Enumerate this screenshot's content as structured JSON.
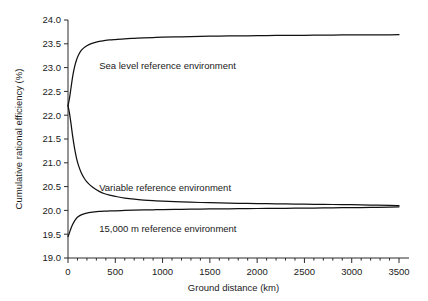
{
  "chart_data": {
    "type": "line",
    "title": "",
    "xlabel": "Ground distance (km)",
    "ylabel": "Cumulative rational efficiency (%)",
    "xlim": [
      0,
      3500
    ],
    "ylim": [
      19.0,
      24.0
    ],
    "xticks": [
      0,
      500,
      1000,
      1500,
      2000,
      2500,
      3000,
      3500
    ],
    "xtick_labels": [
      "0",
      "500",
      "1000",
      "1500",
      "2000",
      "2500",
      "3000",
      "3500"
    ],
    "xminor_step": 100,
    "yticks": [
      19.0,
      19.5,
      20.0,
      20.5,
      21.0,
      21.5,
      22.0,
      22.5,
      23.0,
      23.5,
      24.0
    ],
    "ytick_labels": [
      "19.0",
      "19.5",
      "20.0",
      "20.5",
      "21.0",
      "21.5",
      "22.0",
      "22.5",
      "23.0",
      "23.5",
      "24.0"
    ],
    "grid": false,
    "legend": "inline-annotations",
    "line_color": "#111111",
    "series": [
      {
        "name": "Sea level reference environment",
        "label_position": {
          "x": 330,
          "y": 23.05
        },
        "x": [
          0,
          15,
          30,
          50,
          70,
          90,
          110,
          140,
          170,
          200,
          240,
          280,
          330,
          380,
          440,
          500,
          600,
          700,
          800,
          900,
          1000,
          1200,
          1400,
          1600,
          1800,
          2000,
          2200,
          2400,
          2600,
          2800,
          3000,
          3200,
          3400,
          3500
        ],
        "y": [
          22.2,
          22.35,
          22.55,
          22.82,
          23.02,
          23.16,
          23.26,
          23.36,
          23.42,
          23.46,
          23.5,
          23.525,
          23.55,
          23.565,
          23.58,
          23.59,
          23.605,
          23.615,
          23.625,
          23.632,
          23.638,
          23.648,
          23.656,
          23.662,
          23.667,
          23.671,
          23.675,
          23.678,
          23.681,
          23.684,
          23.686,
          23.688,
          23.69,
          23.691
        ]
      },
      {
        "name": "Variable reference environment",
        "label_position": {
          "x": 330,
          "y": 20.47
        },
        "x": [
          0,
          15,
          30,
          50,
          70,
          90,
          110,
          140,
          170,
          200,
          240,
          280,
          330,
          380,
          440,
          500,
          600,
          700,
          800,
          900,
          1000,
          1200,
          1400,
          1600,
          1800,
          2000,
          2200,
          2400,
          2600,
          2800,
          3000,
          3200,
          3400,
          3500
        ],
        "y": [
          22.2,
          22.05,
          21.85,
          21.55,
          21.3,
          21.1,
          20.95,
          20.79,
          20.68,
          20.6,
          20.52,
          20.46,
          20.4,
          20.355,
          20.32,
          20.295,
          20.26,
          20.235,
          20.218,
          20.205,
          20.195,
          20.178,
          20.166,
          20.157,
          20.15,
          20.144,
          20.139,
          20.134,
          20.129,
          20.124,
          20.119,
          20.113,
          20.105,
          20.098
        ]
      },
      {
        "name": "15,000 m reference environment",
        "label_position": {
          "x": 330,
          "y": 19.62
        },
        "x": [
          0,
          10,
          20,
          35,
          50,
          70,
          90,
          110,
          140,
          170,
          200,
          240,
          280,
          330,
          380,
          440,
          500,
          600,
          700,
          800,
          900,
          1000,
          1200,
          1400,
          1600,
          1800,
          2000,
          2200,
          2400,
          2600,
          2800,
          3000,
          3200,
          3400,
          3500
        ],
        "y": [
          19.45,
          19.5,
          19.56,
          19.64,
          19.71,
          19.78,
          19.835,
          19.87,
          19.905,
          19.928,
          19.944,
          19.958,
          19.968,
          19.977,
          19.983,
          19.988,
          19.992,
          19.999,
          20.004,
          20.009,
          20.013,
          20.017,
          20.023,
          20.028,
          20.032,
          20.036,
          20.04,
          20.043,
          20.047,
          20.05,
          20.054,
          20.058,
          20.063,
          20.07,
          20.075
        ]
      }
    ]
  }
}
